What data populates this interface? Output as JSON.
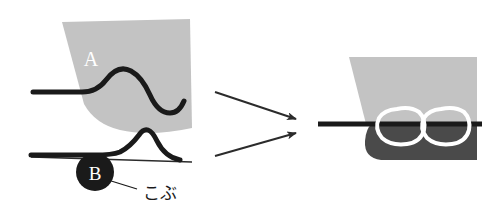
{
  "figure": {
    "background_color": "#ffffff"
  },
  "colors": {
    "light_gray": "#c3c3c3",
    "dark_gray": "#4a4a4a",
    "black": "#1a1a1a",
    "white": "#ffffff",
    "thin_line": "#2b2b2b"
  },
  "panel_a": {
    "label": "A",
    "label_color": "#ffffff",
    "shape_name": "gray-sheet-a",
    "shape_fill": "#c3c3c3",
    "curve_name": "s-wave-curve",
    "curve_color": "#1a1a1a",
    "curve_width": 5
  },
  "panel_b": {
    "label": "B",
    "label_color": "#ffffff",
    "badge_fill": "#1a1a1a",
    "annotation": "こぶ",
    "annotation_color": "#1a1a1a",
    "line_name": "bump-curve",
    "curve_color": "#1a1a1a",
    "curve_width": 5,
    "thin_line_color": "#2b2b2b"
  },
  "arrows": {
    "count": 2,
    "color": "#2b2b2b",
    "items": [
      {
        "name": "arrow-upper",
        "from_label": "panel-a",
        "to_label": "panel-result"
      },
      {
        "name": "arrow-lower",
        "from_label": "panel-b",
        "to_label": "panel-result"
      }
    ]
  },
  "panel_result": {
    "upper_sheet_name": "gray-sheet-result",
    "upper_sheet_fill": "#c3c3c3",
    "lower_sheet_name": "dark-sheet-result",
    "lower_sheet_fill": "#4a4a4a",
    "divider_name": "horizontal-black-line",
    "divider_color": "#1a1a1a",
    "divider_width": 5,
    "loops": [
      {
        "name": "white-loop-left",
        "stroke": "#ffffff",
        "stroke_width": 4
      },
      {
        "name": "white-loop-right",
        "stroke": "#ffffff",
        "stroke_width": 4
      }
    ]
  }
}
